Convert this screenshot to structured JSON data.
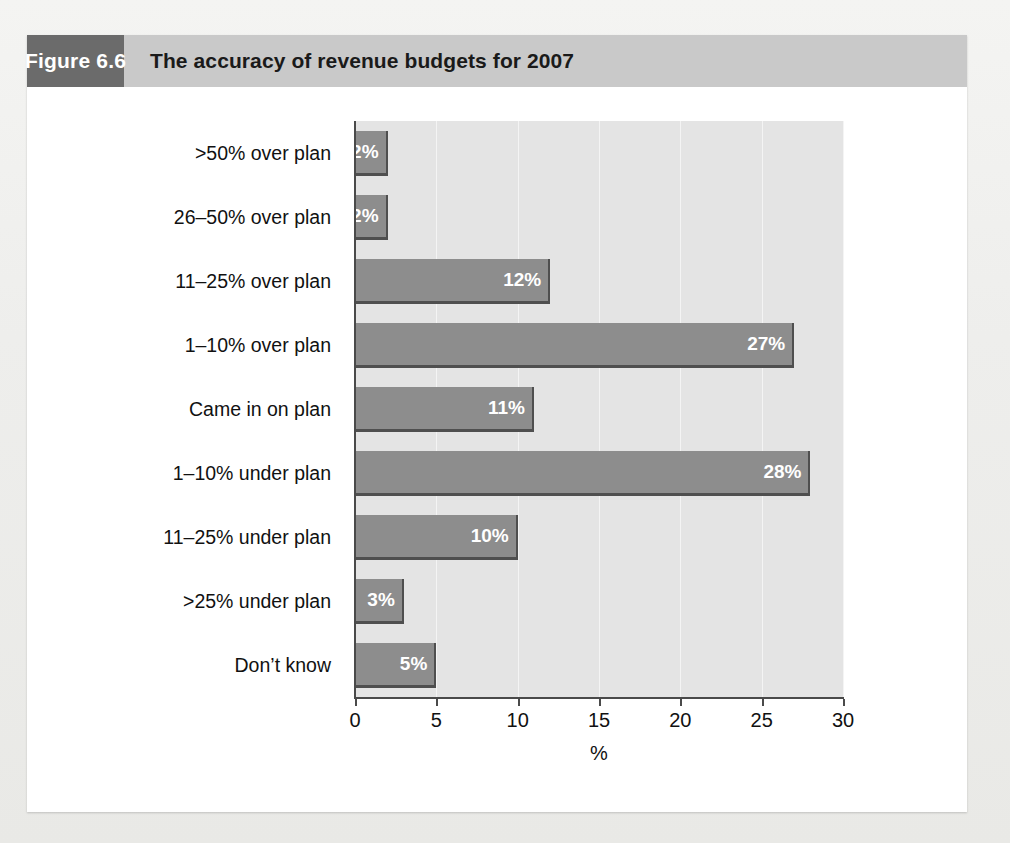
{
  "figure": {
    "number_label": "Figure 6.6",
    "title": "The accuracy of revenue budgets for 2007"
  },
  "chart_data": {
    "type": "bar",
    "orientation": "horizontal",
    "title": "The accuracy of revenue budgets for 2007",
    "xlabel": "%",
    "ylabel": "",
    "xlim": [
      0,
      30
    ],
    "xticks": [
      "0",
      "5",
      "10",
      "15",
      "20",
      "25",
      "30"
    ],
    "xtick_values": [
      0,
      5,
      10,
      15,
      20,
      25,
      30
    ],
    "grid": true,
    "grid_axis": "x",
    "legend": false,
    "categories": [
      ">50% over plan",
      "26–50% over plan",
      "11–25% over plan",
      "1–10% over plan",
      "Came in on plan",
      "1–10% under plan",
      "11–25% under plan",
      ">25% under plan",
      "Don’t know"
    ],
    "values": [
      2,
      2,
      12,
      27,
      11,
      28,
      10,
      3,
      5
    ],
    "data_labels": [
      "2%",
      "2%",
      "12%",
      "27%",
      "11%",
      "28%",
      "10%",
      "3%",
      "5%"
    ],
    "colors": {
      "bar_fill": "#8d8d8d",
      "bar_edge": "#4f4f4f",
      "plot_background": "#e4e4e4",
      "gridline": "#f4f4f4",
      "axis": "#4a4a4a",
      "data_label_text": "#ffffff",
      "header_accent": "#6b6b6b",
      "header_background": "#c9c9c9",
      "card_background": "#ffffff",
      "page_background": "#f0f0ee"
    }
  }
}
